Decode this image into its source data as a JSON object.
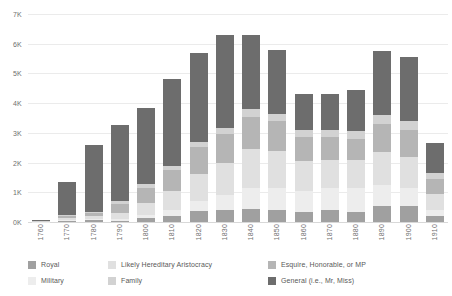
{
  "chart_data": {
    "type": "bar",
    "stacked": true,
    "title": "",
    "subtitle": "",
    "xlabel": "",
    "ylabel": "",
    "grid": true,
    "legend_position": "bottom",
    "ylim": [
      0,
      7000
    ],
    "y_ticks": [
      0,
      1000,
      2000,
      3000,
      4000,
      5000,
      6000,
      7000
    ],
    "y_tick_labels": [
      "0K",
      "1K",
      "2K",
      "3K",
      "4K",
      "5K",
      "6K",
      "7K"
    ],
    "categories": [
      "1760",
      "1770",
      "1780",
      "1790",
      "1800",
      "1810",
      "1820",
      "1830",
      "1840",
      "1850",
      "1860",
      "1870",
      "1880",
      "1890",
      "1900",
      "1910"
    ],
    "series": [
      {
        "name": "General (i.e., Mr, Miss)",
        "color": "#6d6d6d",
        "values": [
          30,
          1100,
          2250,
          2550,
          2580,
          2900,
          3000,
          3150,
          2500,
          2150,
          1200,
          1200,
          1350,
          2150,
          2150,
          1000
        ]
      },
      {
        "name": "Family",
        "color": "#d2d2d2",
        "values": [
          10,
          60,
          60,
          100,
          120,
          160,
          180,
          200,
          250,
          250,
          250,
          260,
          280,
          300,
          300,
          200
        ]
      },
      {
        "name": "Esquire, Honorable, or MP",
        "color": "#b5b5b5",
        "values": [
          5,
          50,
          80,
          300,
          500,
          700,
          900,
          950,
          1100,
          1000,
          800,
          750,
          700,
          950,
          900,
          500
        ]
      },
      {
        "name": "Likely Hereditary Aristocracy",
        "color": "#e0e0e0",
        "values": [
          5,
          60,
          100,
          200,
          400,
          650,
          900,
          1100,
          1300,
          1250,
          1000,
          950,
          950,
          1100,
          1050,
          550
        ]
      },
      {
        "name": "Military",
        "color": "#ededed",
        "values": [
          3,
          30,
          50,
          60,
          120,
          200,
          350,
          500,
          700,
          750,
          700,
          750,
          800,
          700,
          600,
          200
        ]
      },
      {
        "name": "Royal",
        "color": "#a0a0a0",
        "values": [
          2,
          50,
          60,
          40,
          130,
          190,
          370,
          400,
          450,
          400,
          350,
          400,
          350,
          550,
          550,
          200
        ]
      }
    ],
    "totals": [
      55,
      1350,
      2600,
      3250,
      3850,
      4800,
      5700,
      6300,
      6300,
      5800,
      4300,
      4310,
      4430,
      5750,
      5550,
      2650
    ]
  },
  "legend": {
    "columns": [
      {
        "items": [
          {
            "label": "Royal",
            "color": "#a0a0a0",
            "icon": "legend-swatch-icon"
          },
          {
            "label": "Military",
            "color": "#ededed",
            "icon": "legend-swatch-icon"
          }
        ]
      },
      {
        "items": [
          {
            "label": "Likely Hereditary Aristocracy",
            "color": "#e0e0e0",
            "icon": "legend-swatch-icon"
          },
          {
            "label": "Family",
            "color": "#d2d2d2",
            "icon": "legend-swatch-icon"
          }
        ]
      },
      {
        "items": [
          {
            "label": "Esquire, Honorable, or MP",
            "color": "#b5b5b5",
            "icon": "legend-swatch-icon"
          },
          {
            "label": "General (i.e., Mr, Miss)",
            "color": "#6d6d6d",
            "icon": "legend-swatch-icon"
          }
        ]
      }
    ]
  },
  "style": {
    "background": "#ffffff",
    "gridline_color": "#ebebeb",
    "baseline_color": "#d8d8d8",
    "tick_text_color": "#6f6f6f",
    "legend_text_color": "#595959"
  }
}
